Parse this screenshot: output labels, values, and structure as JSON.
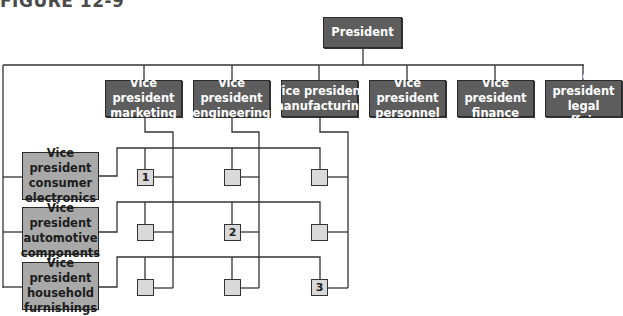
{
  "figure_label": "FIGURE 12-9",
  "president": {
    "label": "President"
  },
  "functional_vps": [
    {
      "line1": "Vice president",
      "line2": "marketing"
    },
    {
      "line1": "Vice president",
      "line2": "engineering"
    },
    {
      "line1": "Vice president",
      "line2": "manufacturing"
    },
    {
      "line1": "Vice president",
      "line2": "personnel"
    },
    {
      "line1": "Vice president",
      "line2": "finance"
    },
    {
      "line1": "Vice president",
      "line2": "legal affairs"
    }
  ],
  "division_vps": [
    {
      "line1": "Vice president",
      "line2": "consumer",
      "line3": "electronics"
    },
    {
      "line1": "Vice president",
      "line2": "automotive",
      "line3": "components"
    },
    {
      "line1": "Vice president",
      "line2": "household",
      "line3": "furnishings"
    }
  ],
  "matrix_cells": [
    [
      "1",
      "",
      ""
    ],
    [
      "",
      "2",
      ""
    ],
    [
      "",
      "",
      "3"
    ]
  ],
  "colors": {
    "functional_box": "#5d5d5d",
    "division_box": "#a9a9a9",
    "matrix_cell": "#d9d9d9",
    "line": "#333333"
  }
}
